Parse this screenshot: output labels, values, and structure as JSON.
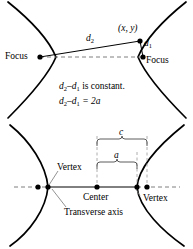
{
  "figure": {
    "stroke_color": "#000000",
    "dash_color": "#8a8a8a",
    "background": "#ffffff"
  },
  "top_panel": {
    "name": "hyperbola-focal-definition",
    "labels": {
      "focus_left": "Focus",
      "focus_right": "Focus",
      "point": "(x, y)",
      "d2": "d",
      "d2_sub": "2",
      "d1": "d",
      "d1_sub": "1"
    },
    "equations": [
      {
        "id": "eq-constant",
        "lhs_var": "d",
        "lhs_sub": "2",
        "minus": "–",
        "rhs_var": "d",
        "rhs_sub": "1",
        "tail": " is constant."
      },
      {
        "id": "eq-two-a",
        "lhs_var": "d",
        "lhs_sub": "2",
        "minus": "–",
        "rhs_var": "d",
        "rhs_sub": "1",
        "tail": " = 2a"
      }
    ]
  },
  "bottom_panel": {
    "name": "hyperbola-parts",
    "labels": {
      "vertex_left": "Vertex",
      "vertex_right": "Vertex",
      "center": "Center",
      "transverse_axis": "Transverse axis",
      "brace_outer": "c",
      "brace_inner": "a"
    },
    "points": [
      {
        "name": "focus-left-dot",
        "x": 38,
        "y": 187
      },
      {
        "name": "vertex-left-dot",
        "x": 48,
        "y": 187
      },
      {
        "name": "center-dot",
        "x": 97,
        "y": 187
      },
      {
        "name": "vertex-right-dot",
        "x": 137,
        "y": 187
      },
      {
        "name": "focus-right-dot",
        "x": 147,
        "y": 187
      }
    ]
  }
}
